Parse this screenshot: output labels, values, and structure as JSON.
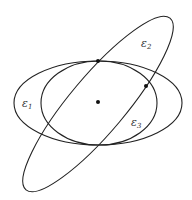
{
  "diagram": {
    "type": "ellipses",
    "colors": {
      "stroke": "#222222",
      "background": "#ffffff",
      "label": "#333333"
    },
    "center": {
      "x": 98,
      "y": 103
    },
    "ellipses": [
      {
        "id": "e1",
        "label": "ε",
        "subscript": "1",
        "cx": 98,
        "cy": 103,
        "rx": 84,
        "ry": 42,
        "rotate": 0,
        "label_pos": {
          "x": 22,
          "y": 107
        }
      },
      {
        "id": "e2",
        "label": "ε",
        "subscript": "2",
        "cx": 98,
        "cy": 104,
        "rx": 112,
        "ry": 28,
        "rotate": -50,
        "label_pos": {
          "x": 141,
          "y": 47
        }
      },
      {
        "id": "e3",
        "label": "ε",
        "subscript": "3",
        "cx": 99,
        "cy": 103,
        "rx": 58,
        "ry": 42,
        "rotate": 0,
        "label_pos": {
          "x": 131,
          "y": 126
        }
      }
    ],
    "points": [
      {
        "id": "center",
        "x": 98,
        "y": 102
      },
      {
        "id": "top-tangent",
        "x": 98,
        "y": 61
      },
      {
        "id": "right-intersection",
        "x": 146,
        "y": 86
      }
    ]
  }
}
